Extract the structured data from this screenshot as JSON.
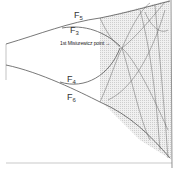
{
  "diagram": {
    "type": "bifurcation-diagram",
    "curve_labels": [
      {
        "id": "F5",
        "base": "F",
        "sub": "5"
      },
      {
        "id": "F3",
        "base": "F",
        "sub": "3"
      },
      {
        "id": "F4",
        "base": "F",
        "sub": "4"
      },
      {
        "id": "F6",
        "base": "F",
        "sub": "6"
      }
    ],
    "annotation": "1st Misiurewicz point →",
    "colors": {
      "curve": "#555555",
      "chaos_fill": "#d9d9d9",
      "axis": "#bbbbbb"
    }
  }
}
